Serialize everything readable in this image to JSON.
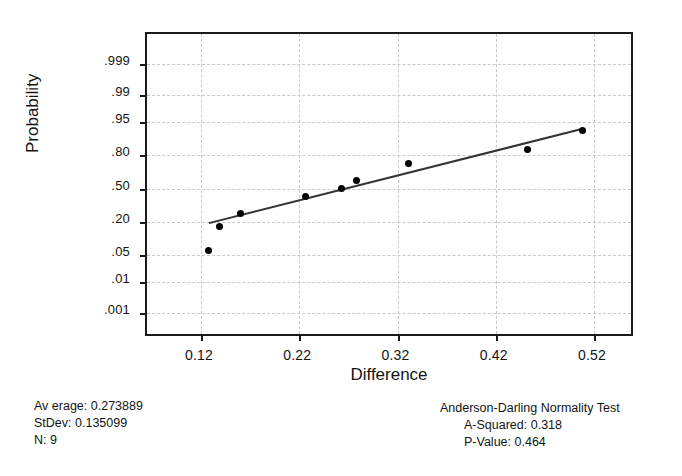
{
  "chart_data": {
    "type": "scatter",
    "title": "",
    "xlabel": "Difference",
    "ylabel": "Probability",
    "xlim": [
      0.065,
      0.5617
    ],
    "xticks": [
      "0.12",
      "0.22",
      "0.32",
      "0.42",
      "0.52"
    ],
    "xtick_values": [
      0.12,
      0.22,
      0.32,
      0.42,
      0.52
    ],
    "yticks": [
      ".001",
      ".01",
      ".05",
      ".20",
      ".50",
      ".80",
      ".95",
      ".99",
      ".999"
    ],
    "ytick_values": [
      0.001,
      0.01,
      0.05,
      0.2,
      0.5,
      0.8,
      0.95,
      0.99,
      0.999
    ],
    "grid": true,
    "legend": "none",
    "points": [
      {
        "x": 0.1272,
        "y": 0.062
      },
      {
        "x": 0.1383,
        "y": 0.172
      },
      {
        "x": 0.16,
        "y": 0.265
      },
      {
        "x": 0.2265,
        "y": 0.425
      },
      {
        "x": 0.2626,
        "y": 0.5
      },
      {
        "x": 0.2787,
        "y": 0.58
      },
      {
        "x": 0.331,
        "y": 0.73
      },
      {
        "x": 0.4527,
        "y": 0.835
      },
      {
        "x": 0.5085,
        "y": 0.925
      }
    ],
    "fit_line": {
      "x_start": 0.128,
      "y_start": 0.195,
      "x_end": 0.5075,
      "y_end": 0.93
    }
  },
  "axes": {
    "x_title": "Difference",
    "y_title": "Probability"
  },
  "stats_left": {
    "average_label": "Av erage:",
    "average_value": "0.273889",
    "stdev_label": "StDev:",
    "stdev_value": "0.135099",
    "n_label": "N:",
    "n_value": "9"
  },
  "stats_right": {
    "test_title": "Anderson-Darling Normality  Test",
    "a_squared_label": "A-Squared:",
    "a_squared_value": "0.318",
    "p_value_label": "P-Value:",
    "p_value_value": "0.464"
  },
  "colors": {
    "axis": "#1b1b1b",
    "grid": "#c9c9c9",
    "point": "#000000",
    "line": "#333333",
    "background": "#ffffff"
  }
}
